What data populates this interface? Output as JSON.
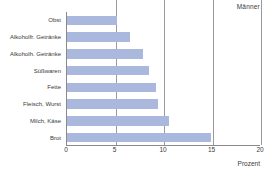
{
  "chart_data": {
    "type": "bar",
    "orientation": "horizontal",
    "title": "Männer",
    "subtitle": "",
    "xlabel": "Prozent",
    "ylabel": "",
    "xlim": [
      0,
      20
    ],
    "xticks": [
      0,
      5,
      10,
      15,
      20
    ],
    "grid": true,
    "grid_axis": "x",
    "legend": false,
    "legend_position": "none",
    "bar_color": "#a9b8dc",
    "axis_color": "#8a8a8a",
    "categories": [
      "Obst",
      "Alkoholfr. Getränke",
      "Alkoholh. Getränke",
      "Süßwaren",
      "Fette",
      "Fleisch, Wurst",
      "Milch, Käse",
      "Brot"
    ],
    "values": [
      5.2,
      6.5,
      7.8,
      8.5,
      9.2,
      9.4,
      10.5,
      14.8
    ],
    "series": [
      {
        "name": "Männer",
        "values": [
          5.2,
          6.5,
          7.8,
          8.5,
          9.2,
          9.4,
          10.5,
          14.8
        ]
      }
    ]
  }
}
